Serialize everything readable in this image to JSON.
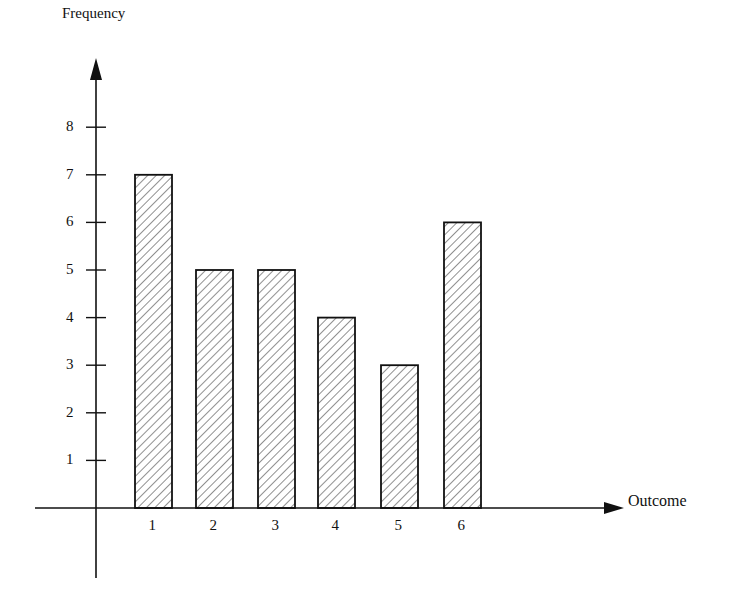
{
  "chart_data": {
    "type": "bar",
    "title": "",
    "xlabel": "Outcome",
    "ylabel": "Frequency",
    "categories": [
      "1",
      "2",
      "3",
      "4",
      "5",
      "6"
    ],
    "values": [
      7,
      5,
      5,
      4,
      3,
      6
    ],
    "yticks": [
      "1",
      "2",
      "3",
      "4",
      "5",
      "6",
      "7",
      "8"
    ],
    "ylim": [
      0,
      9
    ],
    "grid": false,
    "legend": null,
    "bar_fill": "diagonal-hatch",
    "colors": {
      "ink": "#111111",
      "background": "#ffffff"
    }
  }
}
